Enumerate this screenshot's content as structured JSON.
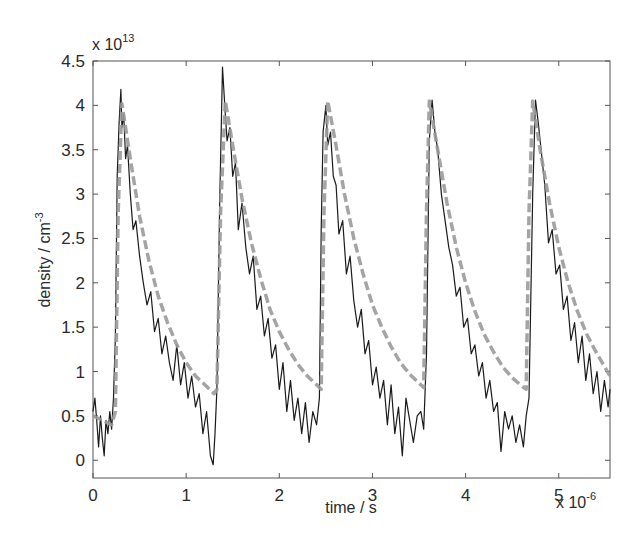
{
  "chart_data": {
    "type": "line",
    "title": "",
    "xlabel": "time / s",
    "ylabel": "density / cm",
    "ylabel_superscript": "-3",
    "x_multiplier": "x 10",
    "x_multiplier_exp": "-6",
    "y_multiplier": "x 10",
    "y_multiplier_exp": "13",
    "xlim": [
      0,
      5.55
    ],
    "ylim": [
      -0.2,
      4.5
    ],
    "xticks": [
      0,
      1,
      2,
      3,
      4,
      5
    ],
    "xtick_labels": [
      "0",
      "1",
      "2",
      "3",
      "4",
      "5"
    ],
    "yticks": [
      0,
      0.5,
      1,
      1.5,
      2,
      2.5,
      3,
      3.5,
      4,
      4.5
    ],
    "ytick_labels": [
      "0",
      "0.5",
      "1",
      "1.5",
      "2",
      "2.5",
      "3",
      "3.5",
      "4",
      "4.5"
    ],
    "grid": false,
    "legend": null,
    "pulse_period_us": 1.1,
    "pulses": [
      {
        "rise_start": 0.24,
        "peak_time": 0.31,
        "peak_measured": 4.18,
        "peak_model": 4.02
      },
      {
        "rise_start": 1.33,
        "peak_time": 1.42,
        "peak_measured": 4.43,
        "peak_model": 4.05
      },
      {
        "rise_start": 2.45,
        "peak_time": 2.52,
        "peak_measured": 4.06,
        "peak_model": 4.05
      },
      {
        "rise_start": 3.55,
        "peak_time": 3.61,
        "peak_measured": 4.06,
        "peak_model": 4.05
      },
      {
        "rise_start": 4.65,
        "peak_time": 4.72,
        "peak_measured": 4.06,
        "peak_model": 4.05
      }
    ],
    "series": [
      {
        "name": "measured",
        "style": "solid",
        "color": "#1a1a1a",
        "x": [
          0.0,
          0.02,
          0.04,
          0.06,
          0.08,
          0.1,
          0.12,
          0.14,
          0.16,
          0.18,
          0.2,
          0.22,
          0.24,
          0.26,
          0.28,
          0.3,
          0.31,
          0.33,
          0.35,
          0.37,
          0.4,
          0.43,
          0.46,
          0.5,
          0.54,
          0.58,
          0.62,
          0.66,
          0.7,
          0.74,
          0.78,
          0.82,
          0.86,
          0.9,
          0.94,
          0.98,
          1.02,
          1.06,
          1.1,
          1.14,
          1.18,
          1.22,
          1.26,
          1.29,
          1.31,
          1.33,
          1.36,
          1.39,
          1.42,
          1.44,
          1.47,
          1.5,
          1.53,
          1.56,
          1.6,
          1.64,
          1.68,
          1.72,
          1.76,
          1.8,
          1.84,
          1.88,
          1.92,
          1.96,
          2.0,
          2.04,
          2.08,
          2.12,
          2.16,
          2.2,
          2.24,
          2.28,
          2.32,
          2.36,
          2.4,
          2.43,
          2.45,
          2.47,
          2.5,
          2.52,
          2.55,
          2.58,
          2.61,
          2.64,
          2.68,
          2.72,
          2.76,
          2.8,
          2.84,
          2.88,
          2.92,
          2.96,
          3.0,
          3.04,
          3.08,
          3.12,
          3.16,
          3.2,
          3.24,
          3.28,
          3.32,
          3.36,
          3.4,
          3.44,
          3.48,
          3.52,
          3.55,
          3.58,
          3.61,
          3.64,
          3.67,
          3.7,
          3.74,
          3.78,
          3.82,
          3.86,
          3.9,
          3.94,
          3.98,
          4.02,
          4.06,
          4.1,
          4.14,
          4.18,
          4.22,
          4.26,
          4.3,
          4.34,
          4.38,
          4.42,
          4.46,
          4.5,
          4.54,
          4.58,
          4.62,
          4.65,
          4.68,
          4.72,
          4.75,
          4.78,
          4.81,
          4.85,
          4.89,
          4.93,
          4.97,
          5.01,
          5.05,
          5.09,
          5.13,
          5.17,
          5.21,
          5.25,
          5.29,
          5.33,
          5.37,
          5.41,
          5.45,
          5.49,
          5.53,
          5.55
        ],
        "y": [
          0.55,
          0.7,
          0.45,
          0.15,
          0.5,
          0.25,
          0.05,
          0.45,
          0.3,
          0.55,
          0.35,
          0.7,
          1.4,
          3.2,
          3.8,
          4.18,
          3.75,
          3.9,
          3.4,
          3.55,
          3.0,
          2.6,
          2.7,
          2.3,
          2.0,
          1.75,
          1.9,
          1.45,
          1.6,
          1.2,
          1.4,
          1.1,
          0.9,
          1.3,
          0.85,
          1.1,
          0.7,
          0.95,
          0.6,
          0.75,
          0.3,
          0.55,
          0.05,
          -0.05,
          0.3,
          0.8,
          2.9,
          4.43,
          3.9,
          3.6,
          3.75,
          3.2,
          3.35,
          2.6,
          2.9,
          2.4,
          2.1,
          2.3,
          1.7,
          1.85,
          1.4,
          1.6,
          1.15,
          1.3,
          0.8,
          1.1,
          0.55,
          0.9,
          0.45,
          0.7,
          0.3,
          0.65,
          0.2,
          0.55,
          0.4,
          0.7,
          2.6,
          3.7,
          4.0,
          3.55,
          3.7,
          3.2,
          3.1,
          2.55,
          2.7,
          2.1,
          2.3,
          1.8,
          1.5,
          1.7,
          1.2,
          1.35,
          0.85,
          1.05,
          0.7,
          0.9,
          0.4,
          0.85,
          0.3,
          0.6,
          0.05,
          0.7,
          0.45,
          0.2,
          0.5,
          0.55,
          0.35,
          1.2,
          3.6,
          4.06,
          3.7,
          3.5,
          3.0,
          2.7,
          2.4,
          2.2,
          1.85,
          1.95,
          1.5,
          1.6,
          1.2,
          1.3,
          0.95,
          1.1,
          0.7,
          0.9,
          0.55,
          0.65,
          0.1,
          0.55,
          0.35,
          0.5,
          0.2,
          0.4,
          0.15,
          0.5,
          0.7,
          3.0,
          4.06,
          3.8,
          3.5,
          3.1,
          2.45,
          2.6,
          2.1,
          2.2,
          1.7,
          1.85,
          1.35,
          1.55,
          1.1,
          1.4,
          0.9,
          1.2,
          0.75,
          1.0,
          0.55,
          0.9,
          0.6,
          0.8
        ]
      },
      {
        "name": "model",
        "style": "dashed",
        "color": "#9a9a9a",
        "x": [
          0.0,
          0.1,
          0.2,
          0.24,
          0.27,
          0.31,
          0.4,
          0.5,
          0.6,
          0.7,
          0.8,
          0.9,
          1.0,
          1.1,
          1.2,
          1.3,
          1.33,
          1.37,
          1.42,
          1.5,
          1.6,
          1.7,
          1.8,
          1.9,
          2.0,
          2.1,
          2.2,
          2.3,
          2.4,
          2.45,
          2.48,
          2.52,
          2.6,
          2.7,
          2.8,
          2.9,
          3.0,
          3.1,
          3.2,
          3.3,
          3.4,
          3.5,
          3.55,
          3.58,
          3.61,
          3.7,
          3.8,
          3.9,
          4.0,
          4.1,
          4.2,
          4.3,
          4.4,
          4.5,
          4.6,
          4.65,
          4.68,
          4.72,
          4.8,
          4.9,
          5.0,
          5.1,
          5.2,
          5.3,
          5.4,
          5.55
        ],
        "y": [
          0.5,
          0.45,
          0.4,
          0.55,
          2.8,
          4.02,
          3.4,
          2.75,
          2.25,
          1.85,
          1.55,
          1.3,
          1.1,
          0.95,
          0.85,
          0.75,
          0.8,
          2.8,
          4.05,
          3.55,
          2.95,
          2.45,
          2.05,
          1.7,
          1.45,
          1.25,
          1.08,
          0.95,
          0.85,
          0.8,
          2.8,
          4.05,
          3.6,
          3.0,
          2.5,
          2.1,
          1.75,
          1.5,
          1.28,
          1.1,
          0.97,
          0.87,
          0.82,
          2.8,
          4.05,
          3.5,
          2.9,
          2.4,
          2.0,
          1.68,
          1.42,
          1.22,
          1.05,
          0.93,
          0.84,
          0.8,
          2.8,
          4.05,
          3.5,
          2.9,
          2.4,
          2.0,
          1.68,
          1.42,
          1.22,
          0.95
        ]
      }
    ]
  },
  "plot_area": {
    "left": 93,
    "top": 61,
    "right": 610,
    "bottom": 478
  }
}
